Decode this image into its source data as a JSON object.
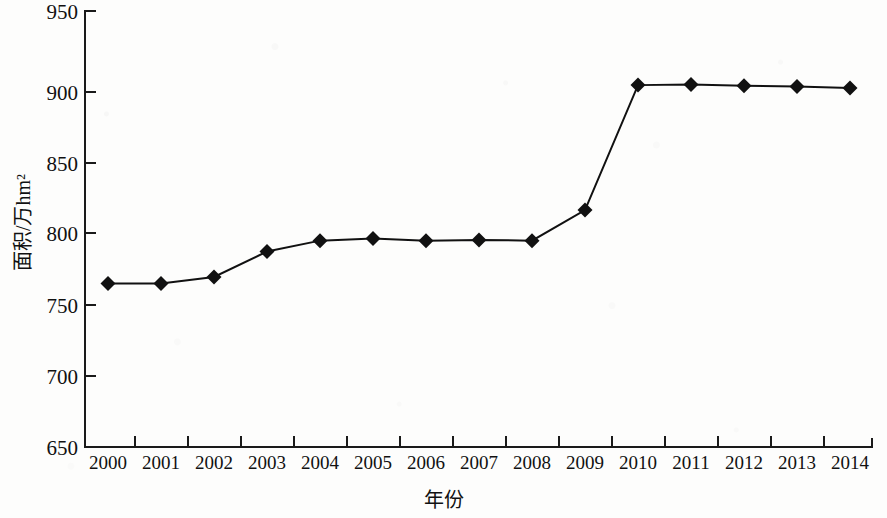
{
  "chart_data": {
    "type": "line",
    "title": "",
    "xlabel": "年份",
    "ylabel": "面积/万hm²",
    "categories": [
      "2000",
      "2001",
      "2002",
      "2003",
      "2004",
      "2005",
      "2006",
      "2007",
      "2008",
      "2009",
      "2010",
      "2011",
      "2012",
      "2013",
      "2014"
    ],
    "values": [
      762.5,
      762.5,
      767.0,
      784.5,
      792.0,
      793.5,
      792.0,
      792.5,
      792.0,
      813.0,
      899.0,
      899.5,
      898.5,
      898.0,
      897.0
    ],
    "ylim": [
      650,
      950
    ],
    "y_ticks": [
      650,
      700,
      750,
      800,
      850,
      900,
      950
    ],
    "x_ticks": [
      "2000",
      "2001",
      "2002",
      "2003",
      "2004",
      "2005",
      "2006",
      "2007",
      "2008",
      "2009",
      "2010",
      "2011",
      "2012",
      "2013",
      "2014"
    ],
    "grid": false,
    "legend": null,
    "marker": "diamond",
    "series_color": "#111111",
    "line_color": "#111111"
  },
  "axes": {
    "y_tick_labels": [
      "950",
      "900",
      "850",
      "800",
      "750",
      "700",
      "650"
    ],
    "x_tick_labels": [
      "2000",
      "2001",
      "2002",
      "2003",
      "2004",
      "2005",
      "2006",
      "2007",
      "2008",
      "2009",
      "2010",
      "2011",
      "2012",
      "2013",
      "2014"
    ],
    "y_title": "面积/万hm²",
    "x_title": "年份"
  },
  "style": {
    "axis_color": "#1a1a1a",
    "background": "#fdfdfc",
    "marker_fill": "#111111"
  }
}
